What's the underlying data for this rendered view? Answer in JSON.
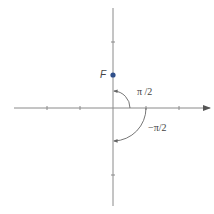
{
  "diagram": {
    "point_label": "F",
    "angle_positive_label": "π /2",
    "angle_negative_label": "−π/2",
    "colors": {
      "axis": "#8a8a8a",
      "point": "#2f4f8a",
      "arc": "#666666",
      "text": "#444444"
    }
  }
}
